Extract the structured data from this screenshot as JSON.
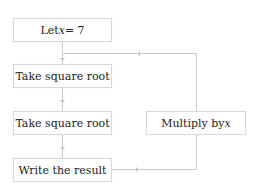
{
  "diagram": {
    "type": "flowchart",
    "nodes": [
      {
        "id": "init",
        "label_prefix": "Let ",
        "label_var": "x",
        "label_suffix": " = 7"
      },
      {
        "id": "sqrt1",
        "label": "Take square root"
      },
      {
        "id": "sqrt2",
        "label": "Take square root"
      },
      {
        "id": "write",
        "label": "Write the result"
      },
      {
        "id": "multiply",
        "label_prefix": "Multiply by ",
        "label_var": "x"
      }
    ],
    "edges": [
      {
        "from": "init",
        "to": "sqrt1"
      },
      {
        "from": "sqrt1",
        "to": "sqrt2"
      },
      {
        "from": "sqrt2",
        "to": "write"
      },
      {
        "from": "write",
        "to": "multiply"
      },
      {
        "from": "multiply",
        "to": "sqrt1"
      }
    ],
    "colors": {
      "line": "#cccccc",
      "box_border": "#d8d8d8",
      "text": "#222222"
    }
  }
}
